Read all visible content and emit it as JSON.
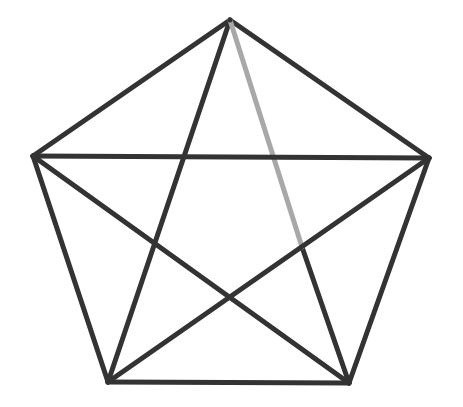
{
  "diagram": {
    "stroke_width": 5,
    "colors": {
      "edge": "#333333",
      "highlight_edge": "#a8a8a8",
      "background": "#ffffff"
    },
    "vertices": [
      {
        "id": "top",
        "x": 230,
        "y": 20
      },
      {
        "id": "right",
        "x": 429,
        "y": 158
      },
      {
        "id": "bottom-right",
        "x": 349,
        "y": 383
      },
      {
        "id": "bottom-left",
        "x": 108,
        "y": 382
      },
      {
        "id": "left",
        "x": 33,
        "y": 156
      }
    ],
    "edges": [
      {
        "from": "top",
        "to": "right",
        "style": "dark"
      },
      {
        "from": "right",
        "to": "bottom-right",
        "style": "dark"
      },
      {
        "from": "bottom-right",
        "to": "bottom-left",
        "style": "dark"
      },
      {
        "from": "bottom-left",
        "to": "left",
        "style": "dark"
      },
      {
        "from": "left",
        "to": "top",
        "style": "dark"
      },
      {
        "from": "top",
        "to": "bottom-left",
        "style": "dark"
      },
      {
        "from": "top",
        "to": "bottom-right",
        "style": "partial-highlight",
        "highlight_until": {
          "x": 302,
          "y": 247
        }
      },
      {
        "from": "left",
        "to": "right",
        "style": "dark"
      },
      {
        "from": "left",
        "to": "bottom-right",
        "style": "dark"
      },
      {
        "from": "right",
        "to": "bottom-left",
        "style": "dark"
      }
    ]
  }
}
